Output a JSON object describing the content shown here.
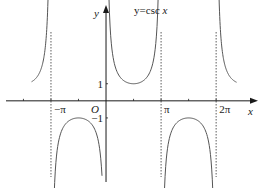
{
  "chart_data": {
    "type": "line",
    "title": "y=csc x",
    "function": "csc",
    "xlabel": "x",
    "ylabel": "y",
    "origin_label": "O",
    "x_tick_labels": [
      {
        "value": -3.14159,
        "label": "−π"
      },
      {
        "value": 3.14159,
        "label": "π"
      },
      {
        "value": 6.28318,
        "label": "2π"
      }
    ],
    "x_minor_ticks": [
      -4.71239,
      -1.5708,
      1.5708,
      4.71239
    ],
    "y_tick_labels": [
      {
        "value": 1,
        "label": "1"
      },
      {
        "value": -1,
        "label": "−1"
      }
    ],
    "asymptotes": [
      -3.14159,
      3.14159,
      6.28318
    ],
    "branches": [
      {
        "x_from": -4.25,
        "x_to": -3.3,
        "sign": 1
      },
      {
        "x_from": 0.16,
        "x_to": 2.98,
        "sign": 1
      },
      {
        "x_from": -3.0,
        "x_to": -0.23,
        "sign": -1
      },
      {
        "x_from": 3.3,
        "x_to": 6.1,
        "sign": -1
      },
      {
        "x_from": 6.45,
        "x_to": 7.45,
        "sign": 1
      }
    ],
    "xlim": [
      -6.05,
      8.9
    ],
    "ylim": [
      -5.1,
      5.9
    ],
    "grid": false,
    "legend": "none",
    "annotation": {
      "text_y": "y=csc ",
      "text_x": "x",
      "position_x": 1.6,
      "position_y": 5.1
    },
    "line_color": "#555555",
    "axis_color": "#1a1a1a",
    "asymptote_color": "#333333"
  }
}
